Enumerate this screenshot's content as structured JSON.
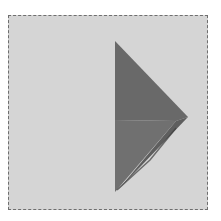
{
  "panel": {
    "background_color": "#d5d5d5",
    "border_color": "#6e6e6e",
    "border_style": "dashed"
  },
  "icon": {
    "name": "play-triangle-icon",
    "direction": "right",
    "colors": {
      "upper_facet": "#696969",
      "lower_facet": "#707070",
      "right_facet": "#5e5e5e",
      "shadow_edge": "#3f3f3f"
    },
    "points": {
      "top": [
        115,
        41
      ],
      "right": [
        188,
        117
      ],
      "bottom": [
        115,
        192
      ],
      "inner_left": [
        115,
        120
      ],
      "inner_right": [
        176,
        121
      ]
    }
  }
}
